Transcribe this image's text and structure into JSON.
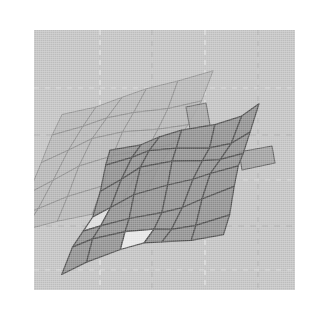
{
  "figure": {
    "title": "",
    "type": "3d-surface-mesh-plot",
    "background_color": "#ffffff",
    "plot_background_color": "#c3c3c3",
    "plot_area": {
      "x": 34,
      "y": 30,
      "width": 261,
      "height": 260
    }
  },
  "grid": {
    "visible": true,
    "style": "dashed",
    "light_line_color": "#e8e8e8",
    "dark_line_color": "#a8a8a8",
    "vertical_light_x": [
      66,
      171
    ],
    "vertical_dark_x": [
      118,
      224
    ],
    "horizontal_dark_y": [
      105,
      196
    ],
    "horizontal_light_y": [
      58,
      150,
      240
    ]
  },
  "surfaces": [
    {
      "name": "upper-surface",
      "label": "Back mesh",
      "fill_color": "#b2b2b2",
      "edge_color": "#8c8c8c",
      "fill_opacity": 0.78,
      "edge_width": 0.9,
      "rows": 5,
      "cols": 5,
      "origin_x": 28,
      "origin_y": 82,
      "col_step_x": 29.5,
      "col_step_y": -8.5,
      "row_step_x": -12.5,
      "row_step_y": 25.0,
      "warp_amplitude": 4.5,
      "warp_frequency": 1.6
    },
    {
      "name": "lower-surface",
      "label": "Front mesh",
      "fill_color": "#878787",
      "edge_color": "#4e4e4e",
      "fill_opacity": 0.86,
      "edge_width": 1.25,
      "rows": 6,
      "cols": 6,
      "origin_x": 76,
      "origin_y": 117,
      "col_step_x": 25.5,
      "col_step_y": -6.5,
      "row_step_x": -7.5,
      "row_step_y": 20.5,
      "warp_amplitude": 5.5,
      "warp_frequency": 1.9,
      "highlight_cells": [
        {
          "row": 3,
          "col": 0,
          "fill": "#e2e2e2"
        },
        {
          "row": 5,
          "col": 2,
          "fill": "#ededed"
        }
      ]
    }
  ],
  "tabs": [
    {
      "name": "right-flange",
      "fill_color": "#9b9b9b",
      "edge_color": "#5e5e5e",
      "points": "205,122 238,116 241,133 208,140"
    },
    {
      "name": "upper-notch",
      "fill_color": "#a2a2a2",
      "edge_color": "#666666",
      "points": "152,77 172,73 176,95 156,99"
    }
  ],
  "legend": {
    "visible": false,
    "entries": []
  },
  "axes": {
    "visible": false,
    "x_ticks": [],
    "y_ticks": [],
    "xlabel": "",
    "ylabel": ""
  }
}
